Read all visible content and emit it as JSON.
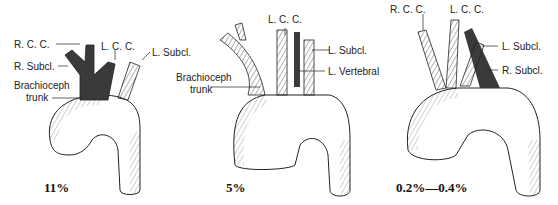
{
  "panels": [
    {
      "percentage": "11%",
      "labels": {
        "rcc": "R. C. C.",
        "lcc": "L. C. C.",
        "rsubcl": "R. Subcl.",
        "lsubcl": "L. Subcl.",
        "brachio1": "Brachioceph",
        "brachio2": "trunk"
      }
    },
    {
      "percentage": "5%",
      "labels": {
        "lcc": "L. C. C.",
        "lsubcl": "L. Subcl.",
        "lvert": "L. Vertebral",
        "brachio1": "Brachioceph",
        "brachio2": "trunk"
      }
    },
    {
      "percentage": "0.2%—0.4%",
      "labels": {
        "rcc": "R. C. C.",
        "lcc": "L. C. C.",
        "lsubcl": "L. Subcl.",
        "rsubcl": "R. Subcl."
      }
    }
  ],
  "colors": {
    "highlight": "#3a3a3a",
    "line": "#222222"
  }
}
